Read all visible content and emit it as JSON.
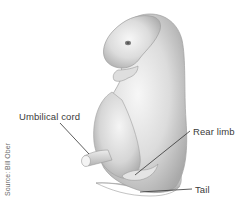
{
  "figure": {
    "labels": [
      {
        "id": "umbilical-cord",
        "text": "Umbilical cord"
      },
      {
        "id": "rear-limb",
        "text": "Rear limb"
      },
      {
        "id": "tail",
        "text": "Tail"
      }
    ],
    "source": "Source: Bill Ober",
    "colors": {
      "background": "#ffffff",
      "body_light": "#f2f2f2",
      "body_mid": "#cfcfcf",
      "body_dark": "#9a9a9a",
      "leader_line": "#333333",
      "label_text": "#3a3a3a"
    }
  }
}
